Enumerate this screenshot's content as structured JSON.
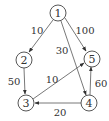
{
  "diagram": {
    "type": "directed-weighted-graph",
    "nodes": [
      {
        "id": "1",
        "label": "1"
      },
      {
        "id": "2",
        "label": "2"
      },
      {
        "id": "3",
        "label": "3"
      },
      {
        "id": "4",
        "label": "4"
      },
      {
        "id": "5",
        "label": "5"
      }
    ],
    "edges": [
      {
        "from": "1",
        "to": "2",
        "weight": "10"
      },
      {
        "from": "1",
        "to": "4",
        "weight": "30"
      },
      {
        "from": "1",
        "to": "5",
        "weight": "100"
      },
      {
        "from": "2",
        "to": "3",
        "weight": "50"
      },
      {
        "from": "3",
        "to": "5",
        "weight": "10"
      },
      {
        "from": "4",
        "to": "3",
        "weight": "20"
      },
      {
        "from": "4",
        "to": "5",
        "weight": "60"
      }
    ]
  }
}
